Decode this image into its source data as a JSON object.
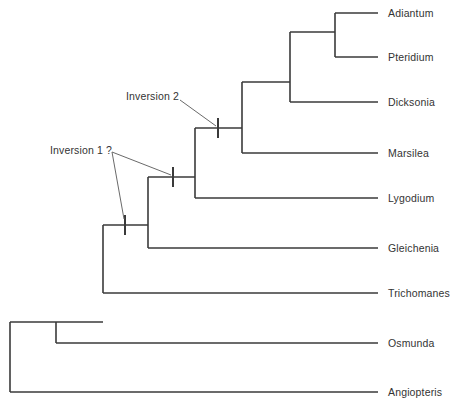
{
  "figure": {
    "type": "cladogram",
    "background_color": "#ffffff",
    "line_color": "#3a3a3a",
    "text_color": "#333333",
    "leader_color": "#6a6a6a"
  },
  "taxa": [
    {
      "name": "Adiantum",
      "label_x": 388,
      "y": 13
    },
    {
      "name": "Pteridium",
      "label_x": 388,
      "y": 57
    },
    {
      "name": "Dicksonia",
      "label_x": 388,
      "y": 102
    },
    {
      "name": "Marsilea",
      "label_x": 388,
      "y": 153
    },
    {
      "name": "Lygodium",
      "label_x": 388,
      "y": 198
    },
    {
      "name": "Gleichenia",
      "label_x": 388,
      "y": 248
    },
    {
      "name": "Trichomanes",
      "label_x": 388,
      "y": 293
    },
    {
      "name": "Osmunda",
      "label_x": 388,
      "y": 343
    },
    {
      "name": "Angiopteris",
      "label_x": 388,
      "y": 392
    }
  ],
  "annotations": [
    {
      "text": "Inversion 2",
      "label_x": 126,
      "label_y": 96
    },
    {
      "text": "Inversion 1 ?",
      "label_x": 50,
      "label_y": 150
    }
  ],
  "events": [
    {
      "name": "inversion-2-tick",
      "x": 218,
      "y": 128
    },
    {
      "name": "inversion-1-tick-a",
      "x": 173,
      "y": 177
    },
    {
      "name": "inversion-1-tick-b",
      "x": 125,
      "y": 225
    }
  ],
  "topology": {
    "description": "Nested ladder: (Angiopteris,(Osmunda,(Trichomanes,(Gleichenia,(Lygodium,(Marsilea,(Dicksonia,(Adiantum,Pteridium))))))))",
    "nodes": [
      {
        "name": "root-node",
        "x": 10,
        "y_top": 322,
        "y_bottom": 392
      },
      {
        "name": "osmunda-node",
        "x": 56,
        "y_top": 322,
        "y_bottom": 343
      },
      {
        "name": "trichomanes-node",
        "x": 103,
        "y_top": 225,
        "y_bottom": 293
      },
      {
        "name": "gleichenia-node",
        "x": 148,
        "y_top": 177,
        "y_bottom": 248
      },
      {
        "name": "lygodium-node",
        "x": 195,
        "y_top": 128,
        "y_bottom": 198
      },
      {
        "name": "marsilea-node",
        "x": 242,
        "y_top": 82,
        "y_bottom": 153
      },
      {
        "name": "dicksonia-node",
        "x": 290,
        "y_top": 32,
        "y_bottom": 102
      },
      {
        "name": "adiantum-pterid-node",
        "x": 335,
        "y_top": 13,
        "y_bottom": 57
      }
    ],
    "tip_line_end_x": 378
  }
}
